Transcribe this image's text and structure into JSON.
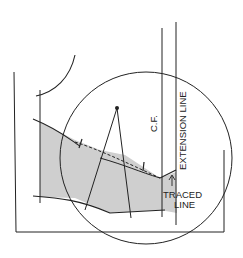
{
  "diagram": {
    "type": "pattern-drafting-detail",
    "labels": {
      "center_front": "C.F.",
      "extension_line": "EXTENSION LINE",
      "traced_line_1": "TRACED",
      "traced_line_2": "LINE"
    },
    "colors": {
      "line": "#222222",
      "shade": "#c8c8c8",
      "background": "#ffffff"
    }
  }
}
